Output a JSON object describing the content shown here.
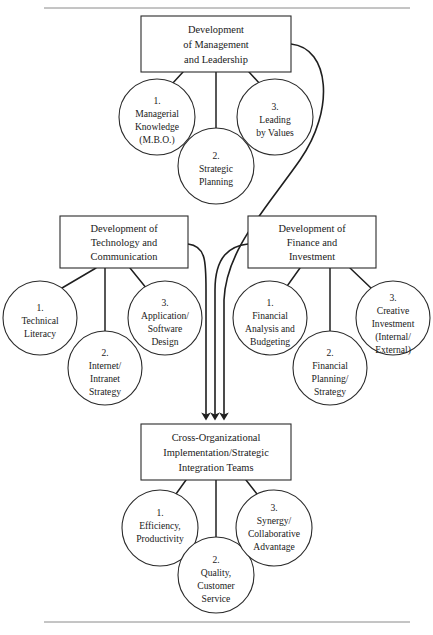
{
  "page": {
    "header_text": "",
    "top_rule": true,
    "bottom_rule": true,
    "background": "#ffffff",
    "ink": "#1f1f1f"
  },
  "diagram": {
    "type": "hierarchical-flow-diagram",
    "boxes": [
      {
        "id": "management",
        "lines": [
          "Development",
          "of Management",
          "and Leadership"
        ],
        "x": 141,
        "y": 16,
        "w": 150,
        "h": 56
      },
      {
        "id": "technology",
        "lines": [
          "Development of",
          "Technology and",
          "Communication"
        ],
        "x": 60,
        "y": 216,
        "w": 128,
        "h": 52
      },
      {
        "id": "finance",
        "lines": [
          "Development of",
          "Finance and",
          "Investment"
        ],
        "x": 248,
        "y": 216,
        "w": 128,
        "h": 52
      },
      {
        "id": "integration",
        "lines": [
          "Cross-Organizational",
          "Implementation/Strategic",
          "Integration Teams"
        ],
        "x": 141,
        "y": 424,
        "w": 150,
        "h": 56
      }
    ],
    "circles": [
      {
        "id": "mgmt-1",
        "group": "management",
        "number": "1.",
        "lines": [
          "Managerial",
          "Knowledge",
          "(M.B.O.)"
        ],
        "cx": 157,
        "cy": 117,
        "r": 38
      },
      {
        "id": "mgmt-2",
        "group": "management",
        "number": "2.",
        "lines": [
          "Strategic",
          "Planning"
        ],
        "cx": 216,
        "cy": 166,
        "r": 38
      },
      {
        "id": "mgmt-3",
        "group": "management",
        "number": "3.",
        "lines": [
          "Leading",
          "by Values"
        ],
        "cx": 275,
        "cy": 117,
        "r": 38
      },
      {
        "id": "tech-1",
        "group": "technology",
        "number": "1.",
        "lines": [
          "Technical",
          "Literacy"
        ],
        "cx": 40,
        "cy": 318,
        "r": 37
      },
      {
        "id": "tech-2",
        "group": "technology",
        "number": "2.",
        "lines": [
          "Internet/",
          "Intranet",
          "Strategy"
        ],
        "cx": 105,
        "cy": 368,
        "r": 37
      },
      {
        "id": "tech-3",
        "group": "technology",
        "number": "3.",
        "lines": [
          "Application/",
          "Software",
          "Design"
        ],
        "cx": 165,
        "cy": 318,
        "r": 37
      },
      {
        "id": "fin-1",
        "group": "finance",
        "number": "1.",
        "lines": [
          "Financial",
          "Analysis and",
          "Budgeting"
        ],
        "cx": 270,
        "cy": 318,
        "r": 37
      },
      {
        "id": "fin-2",
        "group": "finance",
        "number": "2.",
        "lines": [
          "Financial",
          "Planning/",
          "Strategy"
        ],
        "cx": 330,
        "cy": 368,
        "r": 37
      },
      {
        "id": "fin-3",
        "group": "finance",
        "number": "3.",
        "lines": [
          "Creative",
          "Investment",
          "(Internal/",
          "External)"
        ],
        "cx": 393,
        "cy": 318,
        "r": 37
      },
      {
        "id": "integ-1",
        "group": "integration",
        "number": "1.",
        "lines": [
          "Efficiency,",
          "Productivity"
        ],
        "cx": 160,
        "cy": 528,
        "r": 38
      },
      {
        "id": "integ-2",
        "group": "integration",
        "number": "2.",
        "lines": [
          "Quality,",
          "Customer",
          "Service"
        ],
        "cx": 216,
        "cy": 575,
        "r": 38
      },
      {
        "id": "integ-3",
        "group": "integration",
        "number": "3.",
        "lines": [
          "Synergy/",
          "Collaborative",
          "Advantage"
        ],
        "cx": 274,
        "cy": 528,
        "r": 38
      }
    ],
    "flows": [
      {
        "id": "flow-management-to-integration",
        "from": "management",
        "to": "integration",
        "arrow": true
      },
      {
        "id": "flow-technology-to-integration",
        "from": "technology",
        "to": "integration",
        "arrow": true
      },
      {
        "id": "flow-finance-to-integration",
        "from": "finance",
        "to": "integration",
        "arrow": true
      }
    ]
  }
}
